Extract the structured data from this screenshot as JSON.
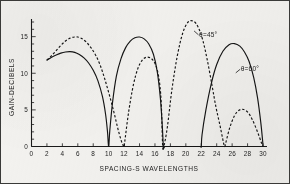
{
  "figure": {
    "border_color": "#3a3a38",
    "background_color": "#f3f2ef",
    "ink_color": "#141414"
  },
  "chart_data": {
    "type": "line",
    "title": "",
    "subtitle": "",
    "xlabel": "SPACING-S WAVELENGTHS",
    "ylabel": "GAIN-DECIBELS",
    "xlim": [
      0,
      30
    ],
    "ylim": [
      0,
      17
    ],
    "grid": false,
    "legend_position": "inline-annotation",
    "xticks": [
      0,
      2,
      4,
      6,
      8,
      10,
      12,
      14,
      16,
      18,
      20,
      22,
      24,
      26,
      28,
      30
    ],
    "xticklabels": [
      "0",
      "2",
      "4",
      "6",
      "8",
      "10",
      "12",
      "14",
      "16",
      "18",
      "20",
      "22",
      "24",
      "26",
      "28",
      "30"
    ],
    "yticks": [
      0,
      5,
      10,
      15
    ],
    "yticklabels": [
      "0",
      "5",
      "10",
      "15"
    ],
    "yminor_step": 1,
    "series": [
      {
        "name": "theta-60",
        "label": "θ = 60°",
        "style": "solid",
        "x": [
          2.0,
          2.6,
          3.2,
          3.8,
          4.4,
          5.0,
          5.6,
          6.2,
          6.8,
          7.4,
          8.0,
          8.6,
          9.2,
          9.6,
          9.85,
          10.0,
          10.15,
          10.5,
          11.0,
          11.6,
          12.2,
          12.8,
          13.4,
          14.0,
          14.6,
          15.2,
          15.8,
          16.3,
          16.7,
          16.95,
          17.1,
          17.3,
          17.9,
          18.6,
          19.4,
          20.2,
          21.0,
          21.6,
          21.9,
          22.0,
          22.1,
          22.6,
          23.3,
          24.0,
          24.8,
          25.6,
          26.3,
          27.0,
          27.6,
          28.2,
          28.8,
          29.3,
          29.7,
          29.95,
          30.0
        ],
        "y": [
          11.8,
          12.2,
          12.5,
          12.75,
          12.9,
          12.95,
          12.85,
          12.55,
          12.1,
          11.4,
          10.4,
          9.0,
          6.8,
          4.4,
          2.0,
          0.0,
          2.2,
          6.0,
          9.6,
          12.0,
          13.5,
          14.4,
          14.85,
          14.95,
          14.7,
          14.0,
          12.6,
          10.2,
          6.6,
          2.8,
          0.0,
          0.0,
          0.0,
          0.0,
          0.0,
          0.0,
          0.0,
          0.0,
          0.0,
          0.0,
          1.6,
          5.0,
          8.6,
          11.2,
          13.0,
          13.9,
          14.05,
          13.7,
          12.9,
          11.6,
          9.4,
          6.6,
          3.4,
          0.8,
          0.0
        ]
      },
      {
        "name": "theta-45",
        "label": "θ = 45°",
        "style": "dashed",
        "x": [
          2.0,
          2.6,
          3.2,
          3.8,
          4.4,
          5.0,
          5.6,
          6.0,
          6.5,
          7.1,
          7.7,
          8.3,
          8.9,
          9.5,
          10.1,
          10.7,
          11.2,
          11.6,
          11.85,
          12.0,
          12.15,
          12.6,
          13.2,
          13.8,
          14.4,
          15.0,
          15.6,
          16.1,
          16.5,
          16.8,
          17.0,
          17.15,
          17.6,
          18.2,
          18.9,
          19.6,
          20.3,
          21.0,
          21.6,
          22.2,
          22.8,
          23.4,
          23.9,
          24.4,
          24.75,
          24.95,
          25.05,
          25.2,
          25.7,
          26.3,
          26.9,
          27.5,
          28.1,
          28.6,
          29.1,
          29.5,
          29.8,
          30.0
        ],
        "y": [
          11.8,
          12.4,
          13.1,
          13.8,
          14.4,
          14.8,
          14.95,
          14.95,
          14.75,
          14.25,
          13.5,
          12.5,
          11.1,
          9.2,
          7.0,
          4.6,
          2.4,
          0.9,
          0.2,
          0.0,
          1.2,
          4.8,
          8.4,
          10.7,
          11.85,
          12.2,
          11.95,
          11.1,
          9.4,
          6.2,
          0.0,
          0.0,
          2.6,
          7.8,
          12.4,
          15.5,
          17.0,
          17.1,
          16.3,
          14.5,
          11.7,
          8.3,
          5.4,
          3.0,
          1.2,
          0.2,
          0.0,
          0.6,
          2.6,
          4.2,
          4.95,
          5.05,
          4.6,
          3.7,
          2.5,
          1.4,
          0.5,
          0.0
        ]
      }
    ],
    "annotations": [
      {
        "name": "annotation-theta-45",
        "text": "θ=45°",
        "x": 21.2,
        "y": 15.3
      },
      {
        "name": "annotation-theta-60",
        "text": "θ=60°",
        "x": 26.6,
        "y": 10.6
      }
    ]
  }
}
